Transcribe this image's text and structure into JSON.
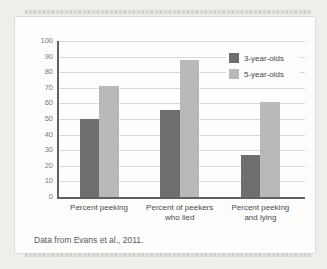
{
  "chart_data": {
    "type": "bar",
    "title": "",
    "xlabel": "",
    "ylabel": "",
    "categories": [
      "Percent peeking",
      "Percent of peekers who lied",
      "Percent peeking and lying"
    ],
    "category_lines": [
      [
        "Percent peeking"
      ],
      [
        "Percent of peekers",
        "who lied"
      ],
      [
        "Percent peeking",
        "and lying"
      ]
    ],
    "series": [
      {
        "name": "3-year-olds",
        "color": "#6e6e6e",
        "values": [
          50,
          56,
          27
        ]
      },
      {
        "name": "5-year-olds",
        "color": "#b9b9b9",
        "values": [
          71,
          88,
          61
        ]
      }
    ],
    "ylim": [
      0,
      100
    ],
    "ytick_step": 10,
    "yticks": [
      0,
      10,
      20,
      30,
      40,
      50,
      60,
      70,
      80,
      90,
      100
    ],
    "grid": true,
    "legend_position": "top-right",
    "caption": "Data from Evans et al., 2011."
  },
  "colors": {
    "page_bg": "#efeeeb",
    "card_bg": "#fdfdfc",
    "axis": "#606060",
    "gridline": "#d9d9d9",
    "tick_label": "#7b7b7b",
    "label_text": "#4a4a4a"
  }
}
